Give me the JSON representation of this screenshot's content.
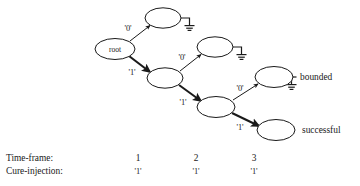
{
  "figure": {
    "root_node_label": "root",
    "nodes": [
      {
        "id": "root",
        "label": "root",
        "cx": 115,
        "cy": 49,
        "rx": 20,
        "ry": 10.5,
        "terminal": false
      },
      {
        "id": "t1",
        "label": "",
        "cx": 163,
        "cy": 18,
        "rx": 18,
        "ry": 10.2,
        "terminal": true
      },
      {
        "id": "n1",
        "label": "",
        "cx": 165,
        "cy": 78,
        "rx": 18,
        "ry": 10.2,
        "terminal": false
      },
      {
        "id": "t2",
        "label": "",
        "cx": 215,
        "cy": 47,
        "rx": 18,
        "ry": 10.2,
        "terminal": true
      },
      {
        "id": "n2",
        "label": "",
        "cx": 216,
        "cy": 107,
        "rx": 19,
        "ry": 10.5,
        "terminal": false
      },
      {
        "id": "t3",
        "label": "",
        "cx": 274,
        "cy": 77,
        "rx": 19,
        "ry": 10.5,
        "terminal": true
      },
      {
        "id": "leaf",
        "label": "",
        "cx": 276,
        "cy": 130,
        "rx": 19,
        "ry": 10.5,
        "terminal": false
      }
    ],
    "edges": [
      {
        "id": "e-root-t1",
        "label": "'0'",
        "thick": false,
        "label_x": 128,
        "label_y": 31
      },
      {
        "id": "e-root-n1",
        "label": "'1'",
        "thick": true,
        "label_x": 132,
        "label_y": 75
      },
      {
        "id": "e-n1-t2",
        "label": "'0'",
        "thick": false,
        "label_x": 182,
        "label_y": 60
      },
      {
        "id": "e-n1-n2",
        "label": "'1'",
        "thick": true,
        "label_x": 183,
        "label_y": 105
      },
      {
        "id": "e-n2-t3",
        "label": "'0'",
        "thick": false,
        "label_x": 240,
        "label_y": 91
      },
      {
        "id": "e-n2-leaf",
        "label": "'1'",
        "thick": true,
        "label_x": 240,
        "label_y": 130
      }
    ],
    "annotations": [
      {
        "id": "bounded",
        "text": "bounded",
        "x": 300,
        "y": 80
      },
      {
        "id": "successful",
        "text": "successful",
        "x": 302,
        "y": 133
      }
    ],
    "legend": {
      "row_labels": [
        "Time-frame:",
        "Cure-injection:"
      ],
      "columns": [
        {
          "index": "1",
          "value": "'1'",
          "x": 138
        },
        {
          "index": "2",
          "value": "'1'",
          "x": 196
        },
        {
          "index": "3",
          "value": "'1'",
          "x": 254
        }
      ],
      "row_label_x": 6,
      "row1_y": 161,
      "row2_y": 174
    },
    "colors": {
      "stroke": "#1a1a1a",
      "fill": "#ffffff",
      "background": "#ffffff"
    }
  }
}
